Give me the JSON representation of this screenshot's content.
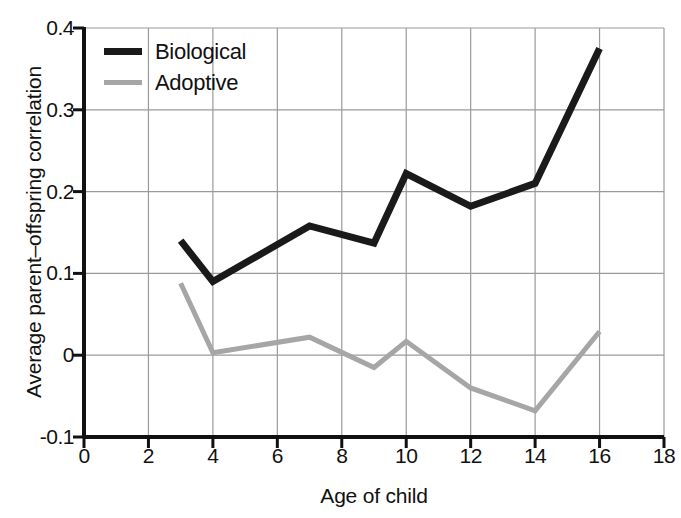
{
  "chart_data": {
    "type": "line",
    "title": "",
    "xlabel": "Age of child",
    "ylabel": "Average parent–offspring correlation",
    "xlim": [
      0,
      18
    ],
    "ylim": [
      -0.1,
      0.4
    ],
    "xticks": [
      "0",
      "2",
      "4",
      "6",
      "8",
      "10",
      "12",
      "14",
      "16",
      "18"
    ],
    "xtick_values": [
      0,
      2,
      4,
      6,
      8,
      10,
      12,
      14,
      16,
      18
    ],
    "yticks": [
      "-0.1",
      "0",
      "0.1",
      "0.2",
      "0.3",
      "0.4"
    ],
    "ytick_values": [
      -0.1,
      0,
      0.1,
      0.2,
      0.3,
      0.4
    ],
    "grid": "both",
    "legend_position": "top-left",
    "x": [
      3,
      4,
      7,
      9,
      10,
      12,
      14,
      16
    ],
    "series": [
      {
        "name": "Biological",
        "color": "#1a1a1a",
        "values": [
          0.14,
          0.09,
          0.158,
          0.137,
          0.222,
          0.182,
          0.21,
          0.375
        ]
      },
      {
        "name": "Adoptive",
        "color": "#a6a6a6",
        "values": [
          0.088,
          0.003,
          0.022,
          -0.015,
          0.017,
          -0.04,
          -0.068,
          0.029
        ]
      }
    ]
  },
  "legend": {
    "items": [
      {
        "label": "Biological"
      },
      {
        "label": "Adoptive"
      }
    ]
  },
  "axes": {
    "x_title": "Age of child",
    "y_title": "Average parent–offspring correlation"
  }
}
